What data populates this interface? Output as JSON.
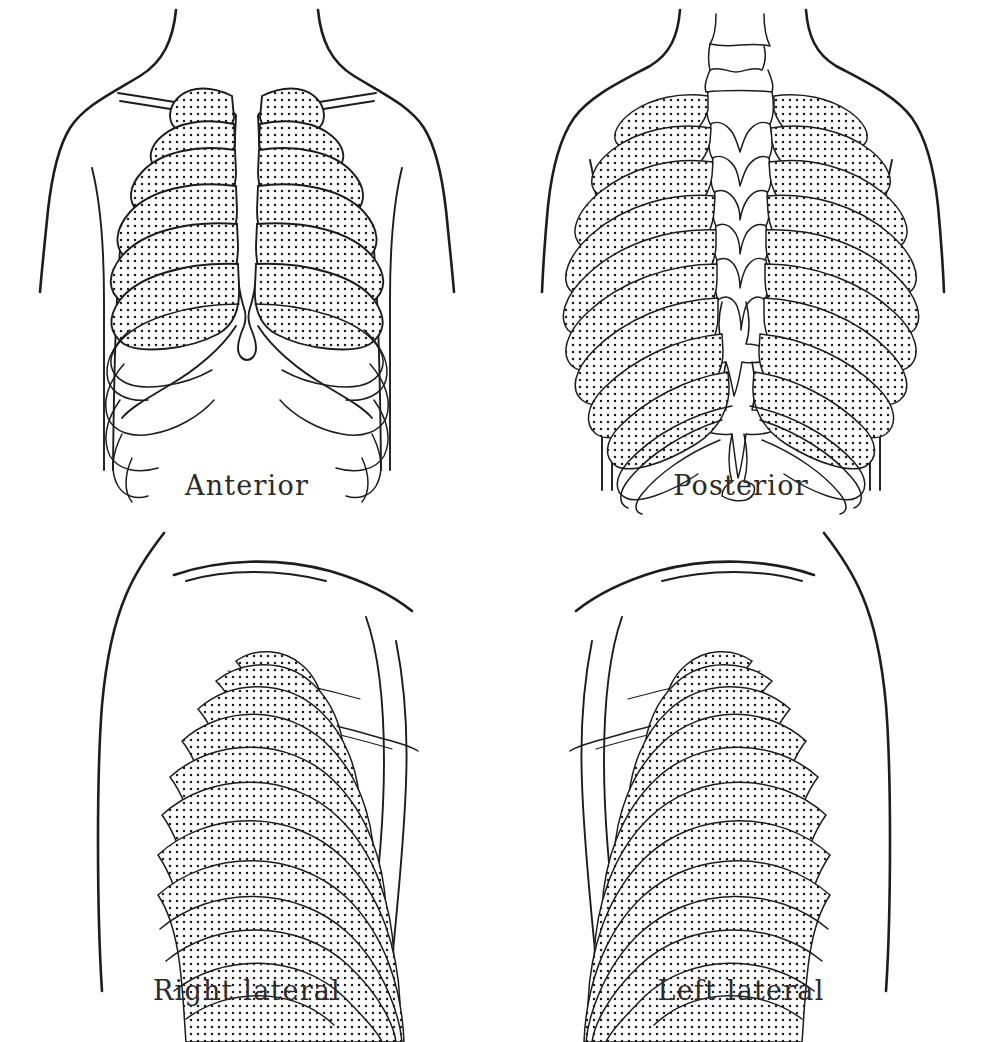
{
  "figure": {
    "background_color": "#ffffff",
    "ink_color": "#1d1d1d",
    "shading_style": "stipple"
  },
  "panels": [
    {
      "id": "anterior",
      "label": "Anterior",
      "description": "Front view of thorax showing sternum, clavicles and ribs 1-10 with costal margin",
      "shaded_ribs": "1-6",
      "unshaded_ribs": "7-10"
    },
    {
      "id": "posterior",
      "label": "Posterior",
      "description": "Back view of thorax showing vertebral column with spinous processes and ribs sloping downward",
      "shaded_ribs": "1-9",
      "unshaded_ribs": "10-12"
    },
    {
      "id": "right-lateral",
      "label": "Right lateral",
      "description": "Right side view of thorax with concentric curved ribs and clavicle",
      "shaded_ribs": "1-8",
      "unshaded_ribs": "9-12"
    },
    {
      "id": "left-lateral",
      "label": "Left lateral",
      "description": "Left side view of thorax with concentric curved ribs and clavicle",
      "shaded_ribs": "1-8",
      "unshaded_ribs": "9-12"
    }
  ],
  "labels": {
    "anterior": "Anterior",
    "posterior": "Posterior",
    "right_lateral": "Right lateral",
    "left_lateral": "Left lateral"
  }
}
